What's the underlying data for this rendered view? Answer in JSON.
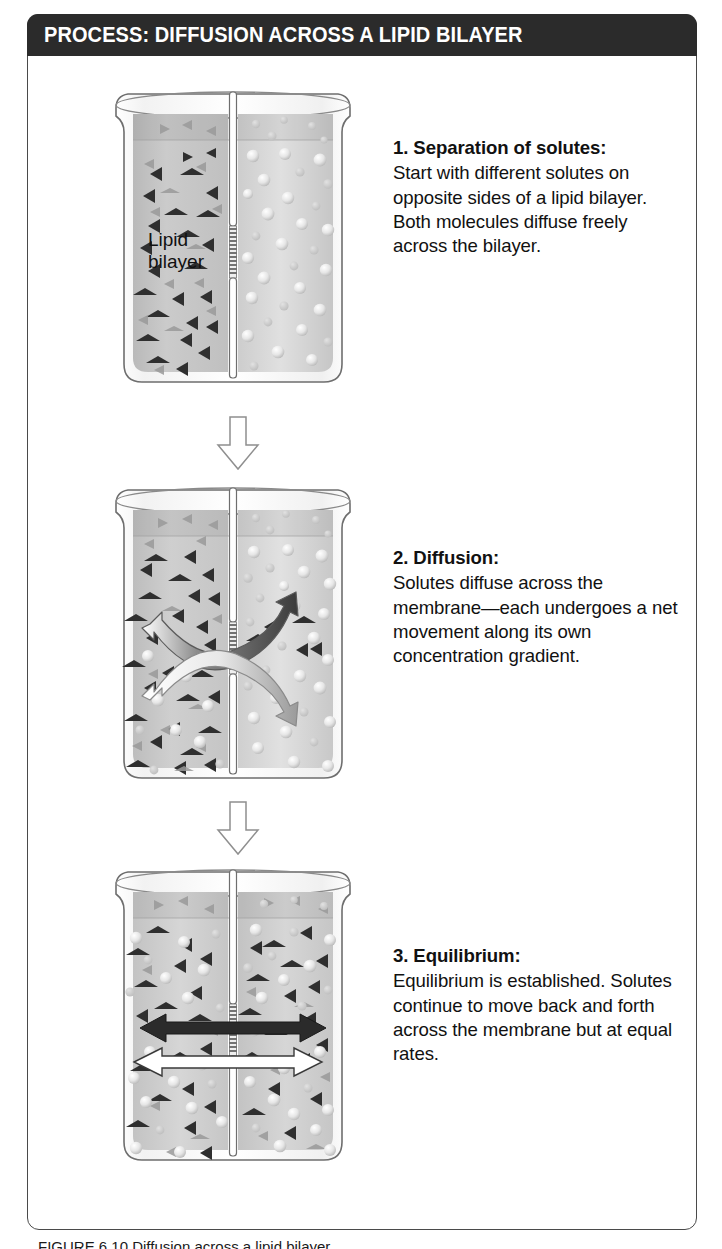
{
  "figure": {
    "header_label": "PROCESS:",
    "header_title": "DIFFUSION ACROSS A LIPID BILAYER",
    "header_full": "PROCESS: DIFFUSION ACROSS A LIPID BILAYER",
    "frame_color": "#4a4a4a",
    "header_bg": "#2b2b2b",
    "header_fg": "#ffffff",
    "caption": "FIGURE 6.10  Diffusion across a lipid bilayer."
  },
  "labels": {
    "lipid_bilayer": "Lipid bilayer",
    "lipid_bilayer_line1": "Lipid",
    "lipid_bilayer_line2": "bilayer"
  },
  "steps": [
    {
      "id": "step-1",
      "number": "1.",
      "title": "1. Separation of solutes:",
      "body": "Start with different solutes on opposite sides of a lipid bilayer. Both molecules diffuse freely across the bilayer.",
      "beaker": {
        "left_solute": "triangles",
        "right_solute": "circles",
        "left_triangle_count": 26,
        "left_circle_count": 0,
        "right_triangle_count": 0,
        "right_circle_count": 34,
        "arrows": []
      }
    },
    {
      "id": "step-2",
      "number": "2.",
      "title": "2. Diffusion:",
      "body": "Solutes diffuse across the membrane—each undergoes a net movement along its own concentration gradient.",
      "beaker": {
        "left_solute": "triangles",
        "right_solute": "circles",
        "left_triangle_count": 28,
        "left_circle_count": 9,
        "right_triangle_count": 5,
        "right_circle_count": 30,
        "arrows": [
          {
            "name": "net-triangle-flux-arrow",
            "style": "curved-double",
            "fill": "#4a4a4a",
            "direction": "net-rightward"
          },
          {
            "name": "net-circle-flux-arrow",
            "style": "curved-double",
            "fill": "#ffffff",
            "direction": "net-leftward"
          }
        ]
      }
    },
    {
      "id": "step-3",
      "number": "3.",
      "title": "3. Equilibrium:",
      "body": "Equilibrium is established. Solutes continue to move back and forth across the membrane but at equal rates.",
      "beaker": {
        "left_solute": "mixed",
        "right_solute": "mixed",
        "left_triangle_count": 20,
        "left_circle_count": 16,
        "right_triangle_count": 18,
        "right_circle_count": 20,
        "arrows": [
          {
            "name": "equal-rate-dark-arrow",
            "style": "straight-double",
            "fill": "#2b2b2b",
            "direction": "bidirectional"
          },
          {
            "name": "equal-rate-light-arrow",
            "style": "straight-double",
            "fill": "#ffffff",
            "direction": "bidirectional"
          }
        ]
      }
    }
  ],
  "connectors": [
    {
      "name": "flow-arrow-1-to-2",
      "direction": "down"
    },
    {
      "name": "flow-arrow-2-to-3",
      "direction": "down"
    }
  ],
  "colors": {
    "liquid_left": "#c9c9c9",
    "liquid_right": "#d6d6d6",
    "glass_outline": "#6e6e6e",
    "triangle_dark": "#2f2f2f",
    "triangle_faded": "#9a9a9a",
    "circle_light": "#ededed",
    "circle_faded": "#c4c4c4",
    "divider": "#ffffff",
    "bilayer_hatch": "#5a5a5a"
  }
}
